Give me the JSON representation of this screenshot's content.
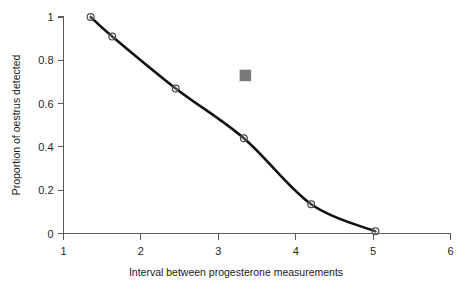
{
  "chart_data": {
    "type": "line",
    "title": "",
    "xlabel": "Interval between progesterone measurements",
    "ylabel": "Proportion of oestrus detected",
    "xlim": [
      1,
      6
    ],
    "ylim": [
      0,
      1
    ],
    "grid": false,
    "legend": "none",
    "xticks": [
      "1",
      "2",
      "3",
      "4",
      "5",
      "6"
    ],
    "xtick_values": [
      1,
      2,
      3,
      4,
      5,
      6
    ],
    "yticks": [
      "0",
      "0.2",
      "0.4",
      "0.6",
      "0.8",
      "1"
    ],
    "ytick_values": [
      0,
      0.2,
      0.4,
      0.6,
      0.8,
      1
    ],
    "series": [
      {
        "name": "Proportion of oestrus detected",
        "marker": "open-circle",
        "line_color": "#111111",
        "marker_color": "#4c4c4c",
        "x": [
          1.35,
          1.63,
          2.45,
          3.33,
          4.2,
          5.03
        ],
        "values": [
          1.0,
          0.91,
          0.67,
          0.44,
          0.135,
          0.01
        ]
      },
      {
        "name": "Single observation",
        "marker": "filled-square",
        "marker_color": "#7a7a7a",
        "x": [
          3.35
        ],
        "values": [
          0.73
        ]
      }
    ]
  },
  "axis": {
    "x_title": "Interval between progesterone measurements",
    "y_title": "Proportion of oestrus detected"
  }
}
